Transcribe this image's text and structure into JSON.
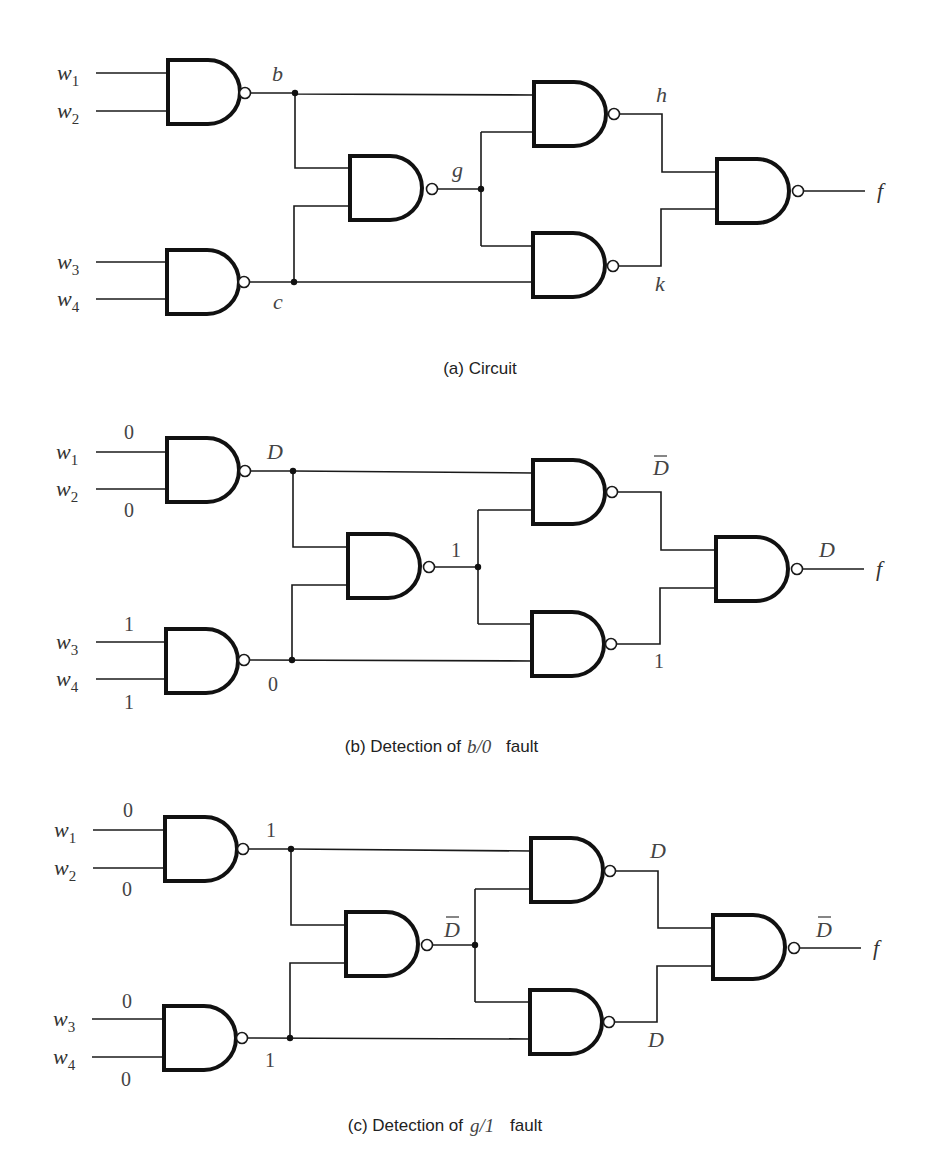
{
  "figure": {
    "inputs": [
      "w",
      "w",
      "w",
      "w"
    ],
    "input_subscripts": [
      "1",
      "2",
      "3",
      "4"
    ],
    "output_label": "f",
    "panels": [
      {
        "id": "a",
        "caption_prefix": "(a) Circuit",
        "caption_math": "",
        "caption_suffix": "",
        "input_values": [
          "",
          "",
          "",
          ""
        ],
        "labels": {
          "b": "b",
          "c": "c",
          "g": "g",
          "h": "h",
          "k": "k",
          "f_val": ""
        },
        "overbar": {
          "b": false,
          "g": false,
          "h": false,
          "k": false,
          "f_val": false
        }
      },
      {
        "id": "b",
        "caption_prefix": "(b) Detection of",
        "caption_math": "b/0",
        "caption_suffix": "fault",
        "input_values": [
          "0",
          "0",
          "1",
          "1"
        ],
        "labels": {
          "b": "D",
          "c": "0",
          "g": "1",
          "h": "D",
          "k": "1",
          "f_val": "D"
        },
        "overbar": {
          "b": false,
          "g": false,
          "h": true,
          "k": false,
          "f_val": false
        }
      },
      {
        "id": "c",
        "caption_prefix": "(c) Detection of",
        "caption_math": "g/1",
        "caption_suffix": "fault",
        "input_values": [
          "0",
          "0",
          "0",
          "0"
        ],
        "labels": {
          "b": "1",
          "c": "1",
          "g": "D",
          "h": "D",
          "k": "D",
          "f_val": "D"
        },
        "overbar": {
          "b": false,
          "g": true,
          "h": false,
          "k": false,
          "f_val": true
        }
      }
    ]
  }
}
